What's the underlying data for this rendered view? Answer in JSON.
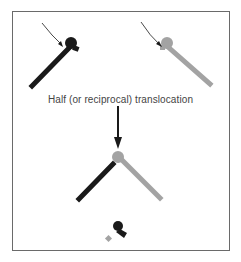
{
  "diagram": {
    "caption": "Half (or reciprocal) translocation",
    "colors": {
      "dark_chromosome": "#1a1a1a",
      "light_chromosome": "#a3a3a3",
      "frame": "#6a6a6a",
      "caption_text": "#444444"
    },
    "elements": [
      {
        "name": "dark-chromosome-with-breakpoint",
        "position": "top-left"
      },
      {
        "name": "light-chromosome-with-breakpoint",
        "position": "top-right"
      },
      {
        "name": "down-arrow",
        "position": "center"
      },
      {
        "name": "translocated-chromosome",
        "position": "bottom-center"
      },
      {
        "name": "lost-fragments",
        "position": "bottom"
      }
    ]
  }
}
